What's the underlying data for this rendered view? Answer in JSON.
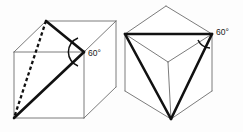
{
  "figure": {
    "background_color": "#fdfdfd",
    "edge_color": "#6d6d6d",
    "highlight_color": "#111111",
    "label_color": "#1a1a1a"
  },
  "diagrams": [
    {
      "id": "left-cube",
      "name": "cube-with-diagonal-triangle",
      "description": "Oblique view of a cube with a bold triangular section and one dashed hidden edge",
      "angle_label": "60°",
      "angle_value": 60,
      "angle_unit": "degrees",
      "cube_outline": "M14,52 L14,118 L84,118 L84,52 Z",
      "cube_top_face": "M14,52 L46,21 L116,21 L84,52 Z",
      "cube_right_face": "M84,52 L116,21 L116,87 L84,118 Z",
      "edges": [
        "M14,52 L14,118",
        "M14,118 L84,118",
        "M84,118 L84,52",
        "M84,52 L14,52",
        "M14,52 L46,21",
        "M46,21 L116,21",
        "M116,21 L84,52",
        "M116,21 L116,87",
        "M116,87 L84,118"
      ],
      "triangle_edges": [
        "M46,21 L84,52",
        "M84,52 L14,118",
        "M46,21 L84,52"
      ],
      "dashed_edge": "M46,21 L14,118",
      "arc_path": "M78,38 A 15 15 0 0 0 78,66",
      "label_x": 88,
      "label_y": 56
    },
    {
      "id": "right-cube",
      "name": "cube-viewed-along-body-diagonal",
      "description": "Cube seen along its body diagonal forming a hexagonal silhouette with a bold inscribed equilateral triangle",
      "angle_label": "60°",
      "angle_value": 60,
      "angle_unit": "degrees",
      "hexagon_outline": "M125,34 L166,6 L212,34 L212,91 L171,119 L125,91 Z",
      "edges": [
        "M125,34 L166,6",
        "M166,6 L212,34",
        "M212,34 L212,91",
        "M212,91 L171,119",
        "M171,119 L125,91",
        "M125,91 L125,34",
        "M125,34 L168,62",
        "M212,34 L168,62",
        "M171,119 L168,62"
      ],
      "triangle_edges": [
        "M125,34 L212,34",
        "M212,34 L171,119",
        "M171,119 L125,34"
      ],
      "arc_path": "M198,40 A 14 14 0 0 0 210,48",
      "label_x": 216,
      "label_y": 35
    }
  ]
}
